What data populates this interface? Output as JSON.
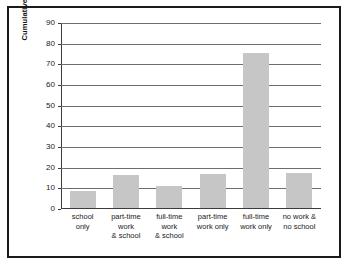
{
  "chart_data": {
    "type": "bar",
    "title": "",
    "xlabel": "",
    "ylabel": "Cumulative Months",
    "ylim": [
      0,
      90
    ],
    "yticks": [
      0,
      10,
      20,
      30,
      40,
      50,
      60,
      70,
      80,
      90
    ],
    "grid": true,
    "legend": "none",
    "categories": [
      "school\nonly",
      "part-time\nwork\n& school",
      "full-time\nwork\n& school",
      "part-time\nwork only",
      "full-time\nwork only",
      "no work &\nno school"
    ],
    "values": [
      8,
      16,
      10.5,
      16.5,
      75,
      17
    ],
    "bar_color": "#c6c6c6",
    "gridline_color": "#6d6d6d",
    "axis_color": "#3b3b3b",
    "frame_color": "#1a1a1a",
    "background": "#ffffff"
  }
}
